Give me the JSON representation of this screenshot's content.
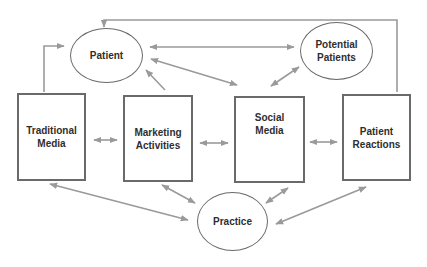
{
  "diagram": {
    "nodes": [
      {
        "id": "patient",
        "shape": "ellipse",
        "label": "Patient"
      },
      {
        "id": "potential_patients",
        "shape": "ellipse",
        "label": "Potential\nPatients"
      },
      {
        "id": "traditional_media",
        "shape": "box",
        "label": "Traditional\nMedia"
      },
      {
        "id": "marketing_activities",
        "shape": "box",
        "label": "Marketing\nActivities"
      },
      {
        "id": "social_media",
        "shape": "box",
        "label": "Social\nMedia"
      },
      {
        "id": "patient_reactions",
        "shape": "box",
        "label": "Patient\nReactions"
      },
      {
        "id": "practice",
        "shape": "ellipse",
        "label": "Practice"
      }
    ],
    "edges": [
      {
        "from": "traditional_media",
        "to": "patient",
        "direction": "forward",
        "style": "elbow"
      },
      {
        "from": "marketing_activities",
        "to": "patient",
        "direction": "forward"
      },
      {
        "from": "patient",
        "to": "potential_patients",
        "direction": "both"
      },
      {
        "from": "patient",
        "to": "social_media",
        "direction": "both"
      },
      {
        "from": "social_media",
        "to": "potential_patients",
        "direction": "both"
      },
      {
        "from": "patient_reactions",
        "to": "patient",
        "direction": "forward",
        "style": "elbow-top"
      },
      {
        "from": "traditional_media",
        "to": "marketing_activities",
        "direction": "both"
      },
      {
        "from": "marketing_activities",
        "to": "social_media",
        "direction": "both"
      },
      {
        "from": "social_media",
        "to": "patient_reactions",
        "direction": "both"
      },
      {
        "from": "traditional_media",
        "to": "practice",
        "direction": "both"
      },
      {
        "from": "marketing_activities",
        "to": "practice",
        "direction": "both"
      },
      {
        "from": "social_media",
        "to": "practice",
        "direction": "both"
      },
      {
        "from": "patient_reactions",
        "to": "practice",
        "direction": "both"
      }
    ],
    "colors": {
      "border": "#6a6a6a",
      "arrow": "#9a9a9a",
      "text": "#2e2e2e"
    }
  }
}
